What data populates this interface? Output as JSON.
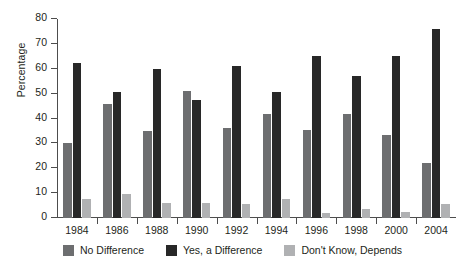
{
  "chart_data": {
    "type": "bar",
    "title": "",
    "xlabel": "",
    "ylabel": "Percentage",
    "ylim": [
      0,
      80
    ],
    "yticks": [
      0,
      10,
      20,
      30,
      40,
      50,
      60,
      70,
      80
    ],
    "grid": false,
    "legend_position": "bottom",
    "categories": [
      "1984",
      "1986",
      "1988",
      "1990",
      "1992",
      "1994",
      "1996",
      "1998",
      "2000",
      "2004"
    ],
    "series": [
      {
        "name": "No Difference",
        "color": "#6d6e70",
        "values": [
          30,
          46,
          35,
          51,
          36,
          42,
          35.5,
          42,
          33.5,
          22
        ]
      },
      {
        "name": "Yes, a Difference",
        "color": "#282828",
        "values": [
          62.5,
          50.5,
          60,
          47.5,
          61,
          50.5,
          65,
          57,
          65,
          76
        ]
      },
      {
        "name": "Don't Know, Depends",
        "color": "#b0b1b3",
        "values": [
          7.5,
          9.5,
          6,
          6,
          5.5,
          7.5,
          2,
          3.5,
          2.5,
          5.5
        ]
      }
    ]
  }
}
